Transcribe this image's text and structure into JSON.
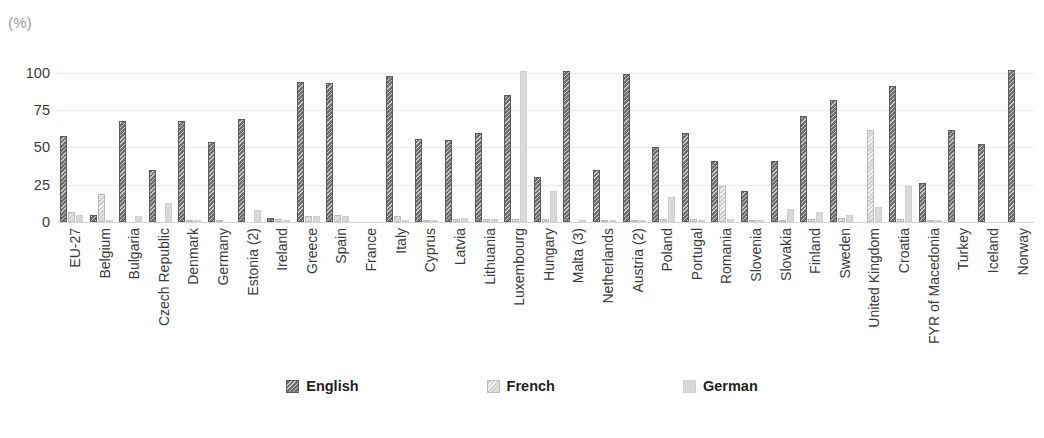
{
  "axis": {
    "unit_label": "(%)",
    "ticks": [
      100,
      75,
      50,
      25,
      0
    ],
    "ymin": 0,
    "ymax": 110
  },
  "top_clipped_text": "",
  "legend": {
    "items": [
      {
        "label": "English",
        "key": "english",
        "color": "#6f6f6f",
        "pattern": "diagonal-hatch-dark"
      },
      {
        "label": "French",
        "key": "french",
        "color": "#d2d2d2",
        "pattern": "diagonal-hatch-light"
      },
      {
        "label": "German",
        "key": "german",
        "color": "#d9d9d9",
        "pattern": "solid"
      }
    ]
  },
  "chart_data": {
    "type": "bar",
    "title": "",
    "xlabel": "",
    "ylabel": "(%)",
    "ylim": [
      0,
      110
    ],
    "grid": true,
    "legend_position": "bottom",
    "categories": [
      "EU-27",
      "Belgium",
      "Bulgaria",
      "Czech Republic",
      "Denmark",
      "Germany",
      "Estonia (2)",
      "Ireland",
      "Greece",
      "Spain",
      "France",
      "Italy",
      "Cyprus",
      "Latvia",
      "Lithuania",
      "Luxembourg",
      "Hungary",
      "Malta (3)",
      "Netherlands",
      "Austria (2)",
      "Poland",
      "Portugal",
      "Romania",
      "Slovenia",
      "Slovakia",
      "Finland",
      "Sweden",
      "United Kingdom",
      "Croatia",
      "FYR of Macedonia",
      "Turkey",
      "Iceland",
      "Norway"
    ],
    "series": [
      {
        "name": "English",
        "values": [
          58,
          5,
          68,
          35,
          68,
          54,
          69,
          3,
          94,
          93,
          0,
          98,
          56,
          55,
          60,
          85,
          30,
          101,
          35,
          99,
          50,
          60,
          41,
          21,
          41,
          71,
          82,
          0,
          91,
          26,
          62,
          52,
          102
        ]
      },
      {
        "name": "French",
        "values": [
          7,
          19,
          0,
          0,
          1,
          1,
          0,
          2,
          4,
          5,
          0,
          4,
          1,
          2,
          2,
          2,
          2,
          0,
          1,
          1,
          2,
          2,
          24,
          1,
          1,
          2,
          3,
          62,
          2,
          1,
          0,
          0,
          0
        ]
      },
      {
        "name": "German",
        "values": [
          5,
          1,
          4,
          13,
          1,
          0,
          8,
          1,
          4,
          4,
          0,
          1,
          1,
          3,
          2,
          101,
          21,
          1,
          1,
          1,
          17,
          1,
          2,
          1,
          9,
          7,
          5,
          10,
          24,
          1,
          0,
          0,
          0
        ]
      }
    ]
  }
}
